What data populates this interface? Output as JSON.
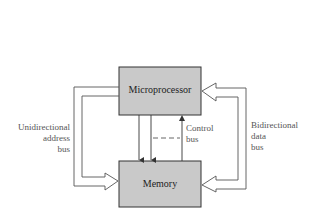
{
  "diagram": {
    "type": "block-diagram",
    "blocks": {
      "microprocessor": {
        "label": "Microprocessor"
      },
      "memory": {
        "label": "Memory"
      }
    },
    "labels": {
      "address_bus": [
        "Unidirectional",
        "address",
        "bus"
      ],
      "control_bus": [
        "Control",
        "bus"
      ],
      "data_bus": [
        "Bidirectional",
        "data",
        "bus"
      ]
    },
    "connections": [
      {
        "name": "unidirectional-address-bus",
        "from": "Microprocessor",
        "to": "Memory",
        "style": "hollow-arrow"
      },
      {
        "name": "bidirectional-data-bus",
        "from": "Memory",
        "to": "Microprocessor",
        "style": "hollow-double-arrow"
      },
      {
        "name": "control-line-1",
        "from": "Microprocessor",
        "to": "Memory",
        "style": "arrow"
      },
      {
        "name": "control-line-2",
        "from": "Microprocessor",
        "to": "Memory",
        "style": "arrow"
      },
      {
        "name": "control-line-3",
        "from": "Memory",
        "to": "Microprocessor",
        "style": "arrow"
      }
    ],
    "colors": {
      "block_fill": "#c9c9c9",
      "block_border": "#333333",
      "line": "#555555",
      "label": "#555555"
    }
  }
}
